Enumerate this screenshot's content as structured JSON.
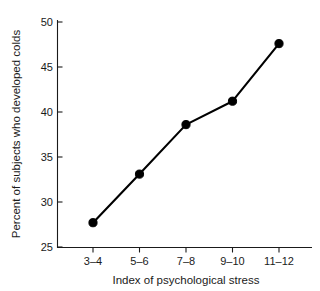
{
  "chart_data": {
    "type": "line",
    "title": "",
    "xlabel": "Index of psychological stress",
    "ylabel": "Percent of subjects who developed colds",
    "categories": [
      "3–4",
      "5–6",
      "7–8",
      "9–10",
      "11–12"
    ],
    "values": [
      27.7,
      33.1,
      38.6,
      41.2,
      47.6
    ],
    "ylim": [
      25,
      50
    ],
    "yticks": [
      25,
      30,
      35,
      40,
      45,
      50
    ],
    "ytick_labels": [
      "25",
      "30",
      "35",
      "40",
      "45",
      "50"
    ],
    "grid": false,
    "legend": false,
    "legend_position": "none",
    "marker": "filled-circle",
    "line_color": "#000000",
    "marker_color": "#000000",
    "background_color": "#ffffff",
    "axis_color": "#1a1a1a"
  },
  "axes": {
    "y_axis_title": "Percent of subjects who developed colds",
    "x_axis_title": "Index of psychological stress"
  }
}
